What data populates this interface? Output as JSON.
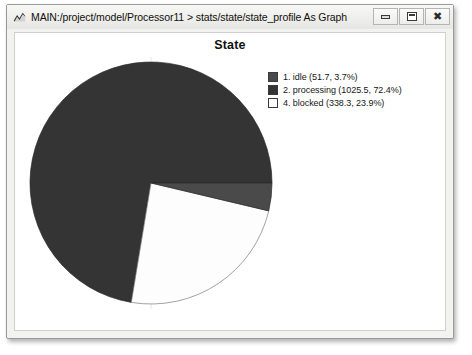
{
  "window": {
    "title": "MAIN:/project/model/Processor11 > stats/state/state_profile As Graph",
    "app_icon_name": "chart-app-icon",
    "controls": {
      "minimize_label": "",
      "maximize_label": "",
      "close_label": "✖"
    }
  },
  "chart_data": {
    "type": "pie",
    "title": "State",
    "xlabel": "",
    "ylabel": "",
    "legend_position": "right",
    "grid": false,
    "start_angle_deg": 0,
    "direction": "clockwise",
    "categories": [
      "idle",
      "processing",
      "blocked"
    ],
    "indices": [
      1,
      2,
      4
    ],
    "values": [
      51.7,
      1025.5,
      338.3
    ],
    "percentages": [
      3.7,
      72.4,
      23.9
    ],
    "colors": [
      "#4a4a4a",
      "#3a3a3a",
      "#fafafa"
    ],
    "slice_order_clockwise": [
      "idle",
      "blocked",
      "processing"
    ],
    "legend": [
      {
        "label": "1. idle (51.7, 3.7%)",
        "name": "idle",
        "index": 1,
        "value": 51.7,
        "percent": 3.7,
        "color": "#4a4a4a"
      },
      {
        "label": "2. processing (1025.5, 72.4%)",
        "name": "processing",
        "index": 2,
        "value": 1025.5,
        "percent": 72.4,
        "color": "#343434"
      },
      {
        "label": "4. blocked (338.3, 23.9%)",
        "name": "blocked",
        "index": 4,
        "value": 338.3,
        "percent": 23.9,
        "color": "#fdfdfd"
      }
    ]
  }
}
